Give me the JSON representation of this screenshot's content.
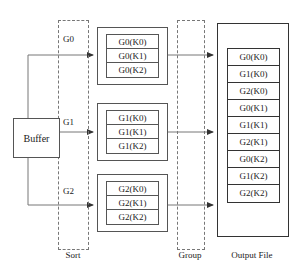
{
  "diagram": {
    "colors": {
      "solid_line": "#555555",
      "dashed_line": "#777777",
      "text": "#1a1a1a",
      "background": "#ffffff"
    },
    "buffer": {
      "label": "Buffer"
    },
    "streams": [
      {
        "tag": "G0"
      },
      {
        "tag": "G1"
      },
      {
        "tag": "G2"
      }
    ],
    "phases": [
      {
        "name": "sort",
        "label": "Sort"
      },
      {
        "name": "group",
        "label": "Group"
      },
      {
        "name": "output",
        "label": "Output File"
      }
    ],
    "sort_runs": [
      {
        "name": "run-g0",
        "cells": [
          "G0(K0)",
          "G0(K1)",
          "G0(K2)"
        ]
      },
      {
        "name": "run-g1",
        "cells": [
          "G1(K0)",
          "G1(K1)",
          "G1(K2)"
        ]
      },
      {
        "name": "run-g2",
        "cells": [
          "G2(K0)",
          "G2(K1)",
          "G2(K2)"
        ]
      }
    ],
    "output_file": {
      "cells": [
        "G0(K0)",
        "G1(K0)",
        "G2(K0)",
        "G0(K1)",
        "G1(K1)",
        "G2(K1)",
        "G0(K2)",
        "G1(K2)",
        "G2(K2)"
      ]
    }
  }
}
